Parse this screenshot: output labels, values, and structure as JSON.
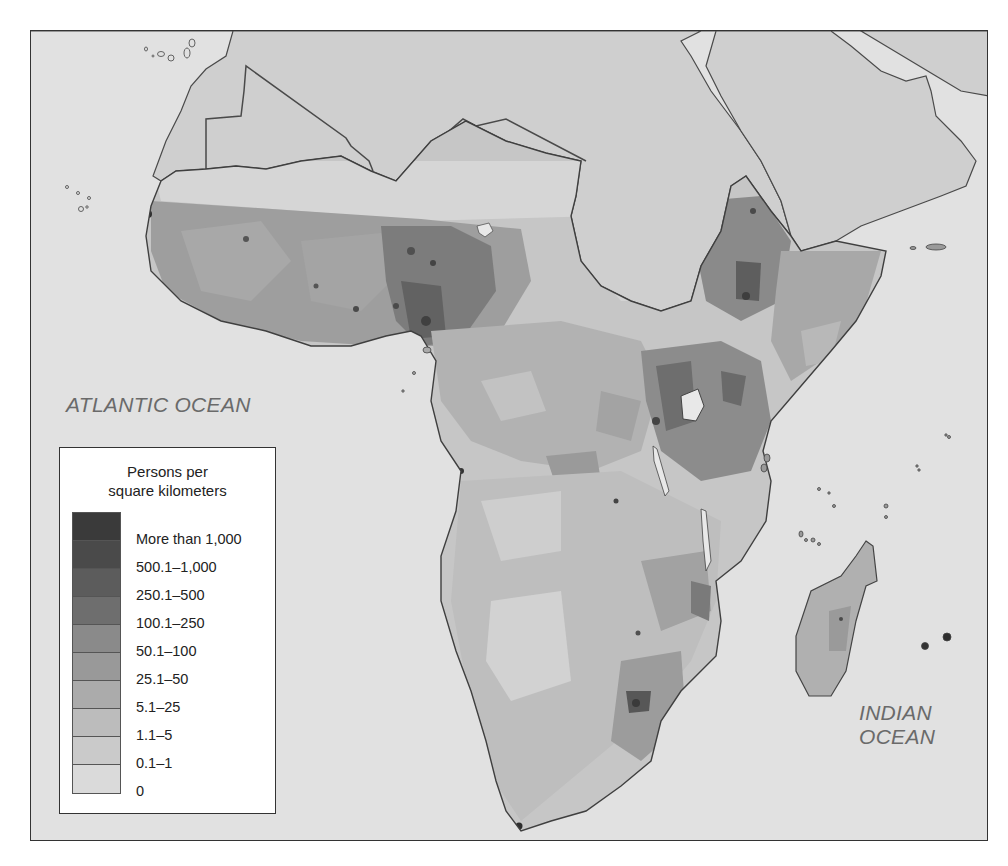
{
  "map": {
    "title": "",
    "ocean_labels": {
      "atlantic": "ATLANTIC OCEAN",
      "indian_line1": "INDIAN",
      "indian_line2": "OCEAN"
    },
    "colors": {
      "ocean": "#e1e1e1",
      "other_land": "#cfcfcf",
      "border": "#4a4a4a"
    }
  },
  "legend": {
    "title_line1": "Persons per",
    "title_line2": "square kilometers",
    "classes": [
      {
        "label": "More than 1,000",
        "color": "#3a3a3a"
      },
      {
        "label": "500.1–1,000",
        "color": "#4a4a4a"
      },
      {
        "label": "250.1–500",
        "color": "#5c5c5c"
      },
      {
        "label": "100.1–250",
        "color": "#6e6e6e"
      },
      {
        "label": "50.1–100",
        "color": "#8a8a8a"
      },
      {
        "label": "25.1–50",
        "color": "#999999"
      },
      {
        "label": "5.1–25",
        "color": "#ababab"
      },
      {
        "label": "1.1–5",
        "color": "#bcbcbc"
      },
      {
        "label": "0.1–1",
        "color": "#cacaca"
      },
      {
        "label": "0",
        "color": "#dadada"
      }
    ]
  }
}
